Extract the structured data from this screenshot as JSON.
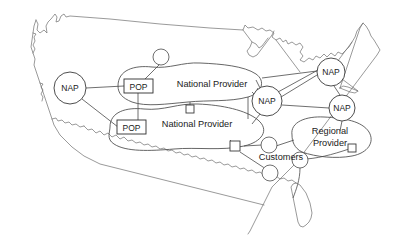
{
  "diagram": {
    "map_region": "United States (contiguous 48 states outline)",
    "colors": {
      "background": "#ffffff",
      "coastline": "#6e6e6e",
      "blob_outline": "#4a4a4a",
      "node_outline": "#3a3a3a",
      "link": "#4a4a4a",
      "text": "#1a1a1a"
    },
    "naps": [
      {
        "label": "NAP",
        "x": 70,
        "y": 88,
        "r": 16
      },
      {
        "label": "NAP",
        "x": 267,
        "y": 101,
        "r": 15
      },
      {
        "label": "NAP",
        "x": 331,
        "y": 72,
        "r": 14
      },
      {
        "label": "NAP",
        "x": 342,
        "y": 108,
        "r": 13
      }
    ],
    "pops": [
      {
        "label": "POP",
        "x": 138,
        "y": 86
      },
      {
        "label": "POP",
        "x": 131,
        "y": 127
      }
    ],
    "providers": [
      {
        "label": "National Provider",
        "x": 212,
        "y": 84,
        "kind": "national"
      },
      {
        "label": "National Provider",
        "x": 197,
        "y": 124,
        "kind": "national"
      },
      {
        "label": "Regional",
        "x": 330,
        "y": 131,
        "kind": "regional"
      },
      {
        "label": "Provider",
        "x": 330,
        "y": 143,
        "kind": "regional"
      }
    ],
    "customers": {
      "label": "Customers",
      "x": 281,
      "y": 157
    },
    "squares": [
      {
        "x": 190,
        "y": 109,
        "size": 8
      },
      {
        "x": 235,
        "y": 146,
        "size": 9
      },
      {
        "x": 352,
        "y": 148,
        "size": 8
      }
    ],
    "small_circles": [
      {
        "x": 161,
        "y": 57,
        "r": 8
      },
      {
        "x": 269,
        "y": 145,
        "r": 8
      },
      {
        "x": 270,
        "y": 173,
        "r": 8
      },
      {
        "x": 300,
        "y": 160,
        "r": 8
      }
    ]
  }
}
